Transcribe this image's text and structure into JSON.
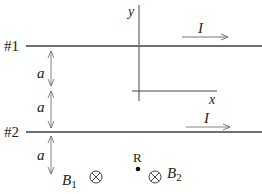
{
  "diagram": {
    "wires": [
      {
        "label": "#1",
        "current_label": "I",
        "direction": "right"
      },
      {
        "label": "#2",
        "current_label": "I",
        "direction": "right"
      }
    ],
    "axes": {
      "x_label": "x",
      "y_label": "y"
    },
    "spacing_labels": [
      "a",
      "a",
      "a"
    ],
    "point": {
      "label": "R"
    },
    "fields": [
      {
        "label": "B",
        "subscript": "1",
        "symbol": "into-page"
      },
      {
        "label": "B",
        "subscript": "2",
        "symbol": "into-page"
      }
    ],
    "colors": {
      "wire": "#707070",
      "line": "#555555",
      "text": "#222222"
    }
  }
}
